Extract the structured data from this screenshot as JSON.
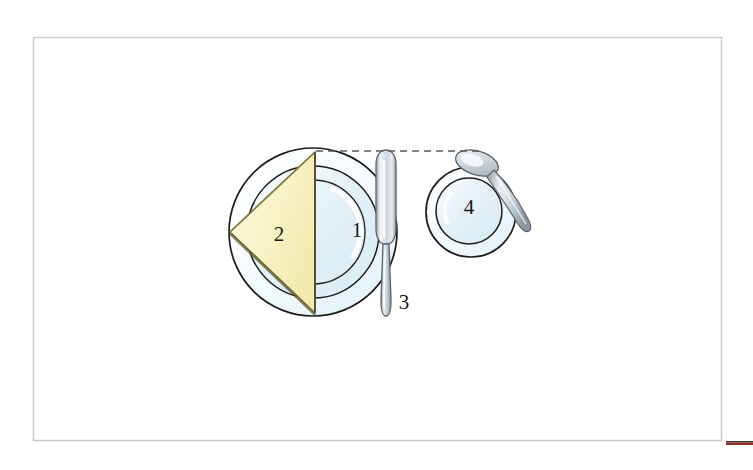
{
  "figure": {
    "background_color": "#ffffff"
  },
  "frame": {
    "name": "page-border",
    "x": 33,
    "y": 37,
    "width": 688,
    "height": 403,
    "stroke_color": "#c9c9c9",
    "stroke_width": 1.4
  },
  "accent_bar": {
    "name": "bottom-right-accent-bar",
    "x": 726,
    "y": 441,
    "width": 27,
    "height": 4,
    "color": "#8a3326",
    "top_edge_color": "#3a3a3a"
  },
  "guide_line": {
    "name": "alignment-guide",
    "style": "dashed",
    "x1": 316,
    "y1": 151,
    "x2": 482,
    "y2": 151,
    "stroke_color": "#5a5a5a",
    "dash_pattern": "7 5"
  },
  "items": [
    {
      "id": "plate",
      "number": "1",
      "label_x": 357,
      "label_y": 232,
      "shape": "circle",
      "center_x": 313,
      "center_y": 232,
      "outer_radius": 84,
      "rim_radius": 66,
      "well_radius": 52,
      "fill_color": "#eaf5f9",
      "stroke_color": "#1c1c1c"
    },
    {
      "id": "napkin",
      "number": "2",
      "label_x": 279,
      "label_y": 236,
      "shape": "triangle",
      "points": "315,152 315,313 230,232",
      "fill_color": "#f8f4cb",
      "fill_color_dark": "#efe8a8",
      "stroke_color": "#6b6330"
    },
    {
      "id": "knife",
      "number": "3",
      "label_x": 404,
      "label_y": 304,
      "shape": "knife",
      "center_x": 386,
      "top_y": 150,
      "bottom_y": 317,
      "fill_color": "#d8dfe4",
      "stroke_color": "#555e66"
    },
    {
      "id": "saucer",
      "number": "4",
      "label_x": 469,
      "label_y": 209,
      "shape": "circle",
      "center_x": 471,
      "center_y": 212,
      "outer_radius": 45,
      "inner_radius": 33,
      "fill_color": "#eaf5f9",
      "stroke_color": "#1c1c1c"
    },
    {
      "id": "spoon",
      "number": "",
      "shape": "spoon",
      "bowl_center_x": 474,
      "bowl_center_y": 163,
      "handle_end_x": 531,
      "handle_end_y": 231,
      "fill_color": "#dfe5ea",
      "stroke_color": "#5b646c"
    }
  ],
  "legend": {
    "1": "plate",
    "2": "napkin",
    "3": "knife",
    "4": "saucer"
  }
}
